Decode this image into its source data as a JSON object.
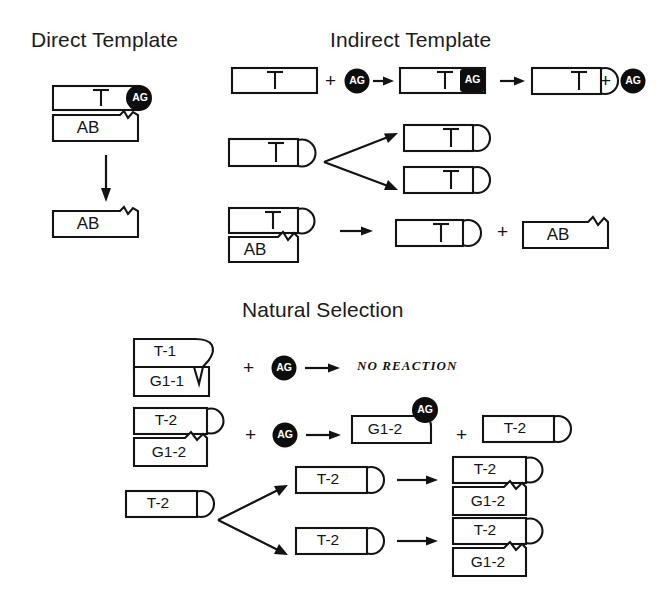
{
  "figure": {
    "sections": [
      {
        "id": "direct",
        "title": "Direct Template"
      },
      {
        "id": "indirect",
        "title": "Indirect Template"
      },
      {
        "id": "natural",
        "title": "Natural Selection"
      }
    ],
    "symbols": {
      "plus": "+",
      "activated_monomer": "AG",
      "no_reaction": "NO REACTION"
    },
    "labels": {
      "template_t": "T",
      "product_ab": "AB",
      "template_t1": "T-1",
      "template_t2": "T-2",
      "product_g1_1": "G1-1",
      "product_g1_2": "G1-2"
    },
    "direct_template": {
      "step1": {
        "top_strand": "T",
        "top_tag": "AG",
        "bottom_strand": "AB"
      },
      "arrow": "down",
      "step2": {
        "strand": "AB"
      }
    },
    "indirect_template": {
      "row1": {
        "reactant_strand": "T",
        "plus": "+",
        "monomer": "AG",
        "arrow1": "right",
        "complex_strand": "T",
        "complex_tag": "AG",
        "arrow2": "right",
        "product_strand": "T",
        "product_plus": "+",
        "released_monomer": "AG"
      },
      "row2": {
        "parent": "T",
        "child_top": "T",
        "child_bottom": "T"
      },
      "row3": {
        "duplex_top": "T",
        "duplex_bottom": "AB",
        "arrow": "right",
        "product_a": "T",
        "plus": "+",
        "product_b": "AB"
      }
    },
    "natural_selection": {
      "row1": {
        "duplex_top": "T-1",
        "duplex_bottom": "G1-1",
        "plus": "+",
        "monomer": "AG",
        "arrow": "right",
        "outcome": "NO REACTION"
      },
      "row2": {
        "duplex_top": "T-2",
        "duplex_bottom": "G1-2",
        "plus": "+",
        "monomer": "AG",
        "arrow": "right",
        "product_strand": "G1-2",
        "product_tag": "AG",
        "plus2": "+",
        "product_template": "T-2"
      },
      "row3": {
        "parent": "T-2",
        "child_top": "T-2",
        "child_bottom": "T-2",
        "arrow_top": "right",
        "arrow_bottom": "right",
        "result_top_a": "T-2",
        "result_top_b": "G1-2",
        "result_bottom_a": "T-2",
        "result_bottom_b": "G1-2"
      }
    },
    "colors": {
      "stroke": "#131313",
      "fill": "#ffffff",
      "monomer_fill": "#0d0d0d",
      "monomer_text": "#ffffff",
      "background": "#ffffff"
    }
  }
}
